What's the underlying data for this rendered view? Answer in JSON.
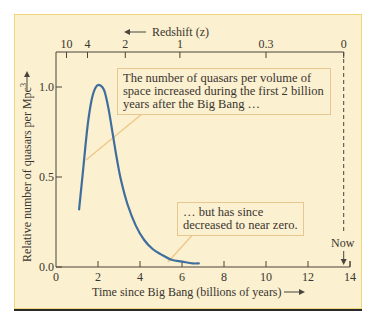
{
  "chart_data": {
    "type": "line",
    "title": "",
    "xlabel": "Time since Big Bang (billions of years)",
    "ylabel": "Relative number of quasars per Mpc³",
    "top_axis_label": "Redshift (z)",
    "xlim": [
      0,
      14
    ],
    "ylim": [
      0.0,
      1.1
    ],
    "x_ticks": [
      0,
      2,
      4,
      6,
      8,
      10,
      12,
      14
    ],
    "x_tick_labels": [
      "0",
      "2",
      "4",
      "6",
      "8",
      "10",
      "12",
      "14"
    ],
    "y_ticks": [
      0.0,
      0.5,
      1.0
    ],
    "y_tick_labels": [
      "0.0",
      "0.5",
      "1.0"
    ],
    "top_ticks_time": [
      0.5,
      1.5,
      3.3,
      5.9,
      10.0,
      13.7
    ],
    "top_tick_labels": [
      "10",
      "4",
      "2",
      "1",
      "0.3",
      "0"
    ],
    "grid": false,
    "series": [
      {
        "name": "Quasar density",
        "color": "#3f6e9e",
        "x": [
          1.1,
          1.3,
          1.5,
          1.7,
          1.9,
          2.1,
          2.3,
          2.5,
          2.7,
          2.9,
          3.1,
          3.4,
          3.8,
          4.2,
          4.6,
          5.0,
          5.5,
          6.0,
          6.5,
          6.8
        ],
        "y": [
          0.32,
          0.55,
          0.78,
          0.93,
          1.0,
          1.01,
          0.98,
          0.88,
          0.74,
          0.6,
          0.48,
          0.35,
          0.23,
          0.15,
          0.1,
          0.07,
          0.04,
          0.03,
          0.02,
          0.02
        ]
      }
    ],
    "annotations": [
      {
        "text": "The number of quasars per volume of space increased during the first 2 billion years after the Big Bang …",
        "points_to": [
          1.4,
          0.6
        ]
      },
      {
        "text": "… but has since decreased to near zero.",
        "points_to": [
          5.4,
          0.03
        ]
      },
      {
        "text": "Now",
        "x": 13.7,
        "marker": "dashed vertical line with down arrow"
      }
    ]
  },
  "labels": {
    "top_axis": "Redshift (z)",
    "x_axis": "Time since Big Bang (billions of years)",
    "y_axis": "Relative number of quasars per Mpc",
    "y_axis_sup": "3",
    "now": "Now",
    "callout1": "The number of quasars per volume of space increased during the first 2 billion years after the Big Bang …",
    "callout2": "… but has since decreased to near zero."
  }
}
